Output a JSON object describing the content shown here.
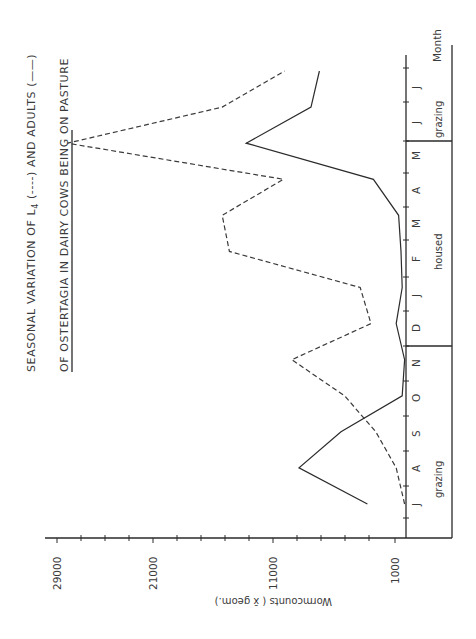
{
  "figure": {
    "title_line1": "SEASONAL VARIATION OF L",
    "title_sub": "4",
    "title_line1_rest": " (----)  AND ADULTS (——)",
    "title_line2": "OF OSTERTAGIA IN DAIRY   COWS BEING ON PASTURE",
    "value_axis_label": "Wormcounts  ( x̄ geom.)",
    "month_axis_label": "Month",
    "value_ticks": [
      "29000",
      "21000",
      "11000",
      "1000"
    ],
    "months": [
      "J",
      "A",
      "S",
      "O",
      "N",
      "D",
      "J",
      "F",
      "M",
      "A",
      "M",
      "J",
      "J"
    ],
    "phases": [
      {
        "label": "grazing",
        "months": "J–N"
      },
      {
        "label": "housed",
        "months": "D–A"
      },
      {
        "label": "grazing",
        "months": "M–J"
      }
    ],
    "legend": [
      {
        "name": "L4",
        "style": "dashed"
      },
      {
        "name": "Adults",
        "style": "solid"
      }
    ],
    "colors": {
      "ink": "#2b2b2b",
      "background": "#ffffff"
    }
  },
  "chart_data": {
    "type": "line",
    "title": "Seasonal variation of L4 (----) and adults (——) of Ostertagia in dairy cows being on pasture",
    "orientation": "rotated 90° (months run bottom-to-top, values increase right-to-left)",
    "categories": [
      "J",
      "A",
      "S",
      "O",
      "N",
      "D",
      "J",
      "F",
      "M",
      "A",
      "M",
      "J",
      "J"
    ],
    "series": [
      {
        "name": "L4 (dashed)",
        "values": [
          200,
          900,
          2600,
          5200,
          9600,
          3000,
          3900,
          14800,
          15400,
          10300,
          28300,
          15400,
          10200
        ]
      },
      {
        "name": "Adults (solid)",
        "values": [
          3300,
          9000,
          5500,
          400,
          200,
          900,
          400,
          500,
          700,
          2800,
          13400,
          8000,
          7300
        ]
      }
    ],
    "xlabel": "Month",
    "ylabel": "Wormcounts (x̄ geom.)",
    "ytick_labels": [
      "1000",
      "11000",
      "21000",
      "29000"
    ],
    "ylim": [
      0,
      30000
    ],
    "annotations": [
      "grazing (J–N)",
      "housed (D–A)",
      "grazing (M–J)"
    ],
    "grid": false,
    "legend_position": "in title"
  }
}
